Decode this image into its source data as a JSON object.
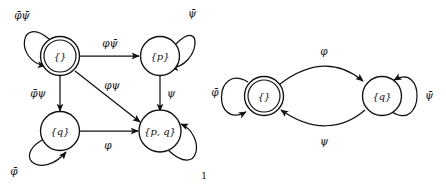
{
  "figure": {
    "number": "1",
    "left_automaton": {
      "name": "left-automaton",
      "states": [
        {
          "id": "empty",
          "label": "{}",
          "accepting": true,
          "initial": true,
          "cx": 60,
          "cy": 56
        },
        {
          "id": "p",
          "label": "{p}",
          "accepting": false,
          "initial": false,
          "cx": 160,
          "cy": 56
        },
        {
          "id": "q",
          "label": "{q}",
          "accepting": false,
          "initial": false,
          "cx": 60,
          "cy": 131
        },
        {
          "id": "pq",
          "label": "{p, q}",
          "accepting": false,
          "initial": false,
          "cx": 160,
          "cy": 131
        }
      ],
      "transitions": [
        {
          "id": "empty-self",
          "from": "empty",
          "to": "empty",
          "label_phi": "φ",
          "label_psi": "ψ",
          "label_text": "φ̄ψ̄",
          "label_x": 22,
          "label_y": 16
        },
        {
          "id": "empty-to-p",
          "from": "empty",
          "to": "p",
          "label_text": "φψ̄",
          "label_x": 110,
          "label_y": 44
        },
        {
          "id": "empty-to-q",
          "from": "empty",
          "to": "q",
          "label_text": "φ̄ψ",
          "label_x": 38,
          "label_y": 94
        },
        {
          "id": "empty-to-pq",
          "from": "empty",
          "to": "pq",
          "label_text": "φψ",
          "label_x": 112,
          "label_y": 86
        },
        {
          "id": "p-self",
          "from": "p",
          "to": "p",
          "label_text": "ψ̄",
          "label_x": 192,
          "label_y": 14
        },
        {
          "id": "p-to-pq",
          "from": "p",
          "to": "pq",
          "label_text": "ψ",
          "label_x": 171,
          "label_y": 94
        },
        {
          "id": "q-self",
          "from": "q",
          "to": "q",
          "label_text": "φ̄",
          "label_x": 14,
          "label_y": 172
        },
        {
          "id": "q-to-pq",
          "from": "q",
          "to": "pq",
          "label_text": "φ",
          "label_x": 108,
          "label_y": 146
        },
        {
          "id": "pq-self",
          "from": "pq",
          "to": "pq",
          "label_text": "",
          "label_x": 0,
          "label_y": 0
        }
      ]
    },
    "right_automaton": {
      "name": "right-automaton",
      "states": [
        {
          "id": "empty",
          "label": "{}",
          "accepting": true,
          "initial": false,
          "cx": 264,
          "cy": 96
        },
        {
          "id": "q",
          "label": "{q}",
          "accepting": false,
          "initial": false,
          "cx": 382,
          "cy": 96
        }
      ],
      "transitions": [
        {
          "id": "r-empty-self",
          "from": "empty",
          "to": "empty",
          "label_text": "φ̄",
          "label_x": 215,
          "label_y": 93
        },
        {
          "id": "r-empty-to-q",
          "from": "empty",
          "to": "q",
          "label_text": "φ",
          "label_x": 324,
          "label_y": 52
        },
        {
          "id": "r-q-to-empty",
          "from": "q",
          "to": "empty",
          "label_text": "ψ",
          "label_x": 324,
          "label_y": 142
        },
        {
          "id": "r-q-self",
          "from": "q",
          "to": "q",
          "label_text": "ψ̄",
          "label_x": 429,
          "label_y": 96
        }
      ]
    }
  },
  "colors": {
    "ink": "#111111",
    "paper": "#ffffff"
  }
}
